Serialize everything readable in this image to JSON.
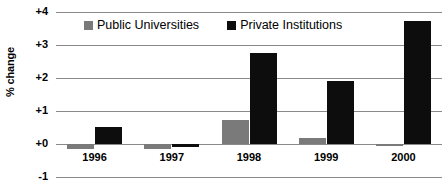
{
  "chart_data": {
    "type": "bar",
    "title": "",
    "xlabel": "",
    "ylabel": "% change",
    "categories": [
      "1996",
      "1997",
      "1998",
      "1999",
      "2000"
    ],
    "series": [
      {
        "name": "Public Universities",
        "color": "#7a7a7a",
        "values": [
          -0.15,
          -0.15,
          0.73,
          0.18,
          -0.05
        ]
      },
      {
        "name": "Private Institutions",
        "color": "#0d0d0d",
        "values": [
          0.52,
          -0.1,
          2.75,
          1.92,
          3.72
        ]
      }
    ],
    "ylim": [
      -1,
      4
    ],
    "ytick_labels": [
      "+4",
      "+3",
      "+2",
      "+1",
      "+0",
      "-1"
    ],
    "ytick_values": [
      4,
      3,
      2,
      1,
      0,
      -1
    ],
    "grid": true,
    "legend_position": "top-center"
  },
  "legend": {
    "entries": [
      {
        "label": "Public Universities",
        "swatch": "public"
      },
      {
        "label": "Private Institutions",
        "swatch": "private"
      }
    ]
  }
}
